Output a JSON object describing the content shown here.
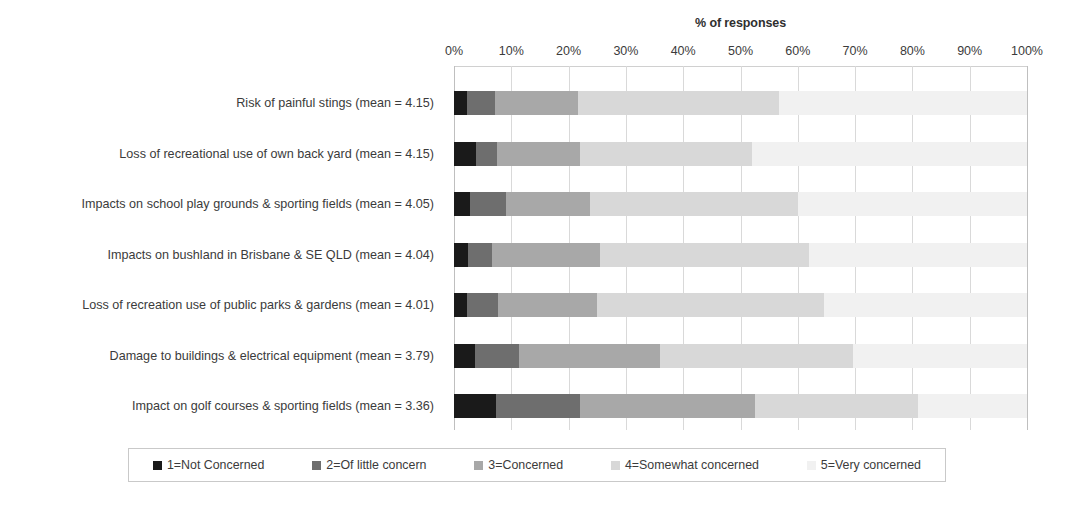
{
  "chart_data": {
    "type": "bar",
    "subtype": "stacked-horizontal-100pct",
    "title": "",
    "xlabel": "% of responses",
    "ylabel": "",
    "xlim": [
      0,
      100
    ],
    "xticks": [
      "0%",
      "10%",
      "20%",
      "30%",
      "40%",
      "50%",
      "60%",
      "70%",
      "80%",
      "90%",
      "100%"
    ],
    "xtick_values": [
      0,
      10,
      20,
      30,
      40,
      50,
      60,
      70,
      80,
      90,
      100
    ],
    "grid": true,
    "legend_position": "bottom",
    "categories": [
      "Risk of painful stings (mean = 4.15)",
      "Loss of recreational use of own back yard (mean = 4.15)",
      "Impacts on school play grounds & sporting fields (mean = 4.05)",
      "Impacts on bushland in Brisbane & SE QLD (mean = 4.04)",
      "Loss of recreation use of public parks & gardens (mean = 4.01)",
      "Damage to buildings & electrical equipment (mean = 3.79)",
      "Impact on golf courses & sporting fields (mean = 3.36)"
    ],
    "series": [
      {
        "name": "1=Not Concerned",
        "color": "#1a1a1a",
        "values": [
          2.2,
          3.8,
          2.8,
          2.4,
          2.2,
          3.7,
          7.3
        ]
      },
      {
        "name": "2=Of little concern",
        "color": "#6e6e6e",
        "values": [
          4.9,
          3.7,
          6.3,
          4.2,
          5.5,
          7.6,
          14.7
        ]
      },
      {
        "name": "3=Concerned",
        "color": "#a8a8a8",
        "values": [
          14.6,
          14.5,
          14.6,
          18.9,
          17.3,
          24.7,
          30.5
        ]
      },
      {
        "name": "4=Somewhat concerned",
        "color": "#d8d8d8",
        "values": [
          35.0,
          30.0,
          36.3,
          36.5,
          39.5,
          33.7,
          28.5
        ]
      },
      {
        "name": "5=Very concerned",
        "color": "#f1f1f1",
        "values": [
          43.3,
          48.0,
          40.0,
          38.0,
          35.5,
          30.3,
          19.0
        ]
      }
    ],
    "legend": [
      "1=Not Concerned",
      "2=Of little concern",
      "3=Concerned",
      "4=Somewhat concerned",
      "5=Very concerned"
    ]
  }
}
